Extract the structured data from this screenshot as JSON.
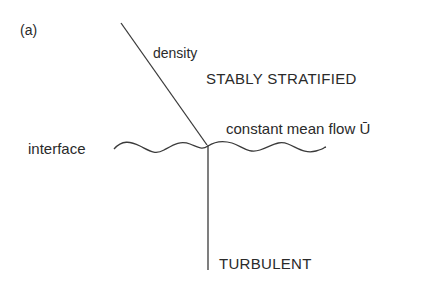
{
  "figure": {
    "panel_label": "(a)",
    "labels": {
      "density": "density",
      "upper_region": "STABLY STRATIFIED",
      "mean_flow": "constant mean flow Ū",
      "interface": "interface",
      "lower_region": "TURBULENT"
    },
    "colors": {
      "line": "#3a3a3a",
      "text": "#2a2a2a",
      "background": "#ffffff"
    }
  }
}
